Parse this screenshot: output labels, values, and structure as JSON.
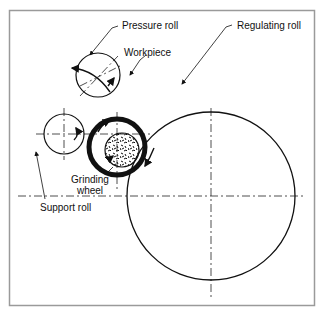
{
  "diagram": {
    "type": "centerless grinding setup",
    "frame_color": "#9a9a9a",
    "line_color": "#111111",
    "labels": {
      "pressure_roll": "Pressure roll",
      "workpiece": "Workpiece",
      "regulating_roll": "Regulating roll",
      "grinding_wheel_line1": "Grinding",
      "grinding_wheel_line2": "wheel",
      "support_roll": "Support roll"
    },
    "components": [
      {
        "name": "Pressure roll",
        "cx": 98,
        "cy": 75,
        "r": 22
      },
      {
        "name": "Support roll",
        "cx": 64,
        "cy": 134,
        "r": 20
      },
      {
        "name": "Grinding wheel",
        "cx": 117,
        "cy": 147,
        "r": 28
      },
      {
        "name": "Workpiece",
        "cx": 122,
        "cy": 150,
        "r": 17
      },
      {
        "name": "Regulating roll",
        "cx": 211,
        "cy": 196,
        "r": 84
      }
    ]
  }
}
